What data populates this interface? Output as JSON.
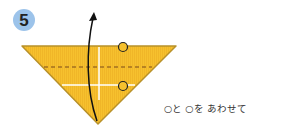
{
  "step": {
    "number": "5"
  },
  "diagram": {
    "paper_color": "#f6c12e",
    "edge_color": "#b8912a",
    "fold_line_color": "#7a4a1a",
    "crease_color": "#ffffff",
    "arrow_color": "#111111",
    "marker_shape": "circle"
  },
  "instructions": {
    "line1": "○と ○を あわせて",
    "line2": "うえの かみだけ おる"
  }
}
